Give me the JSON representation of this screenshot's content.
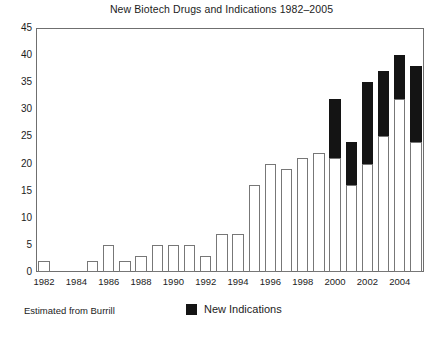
{
  "chart_data": {
    "type": "bar",
    "title": "New Biotech Drugs and Indications 1982–2005",
    "xlabel": "",
    "ylabel": "",
    "stacked": true,
    "grid": false,
    "ylim": [
      0,
      45
    ],
    "ytick_step": 5,
    "yticks": [
      "0",
      "5",
      "10",
      "15",
      "20",
      "25",
      "30",
      "35",
      "40",
      "45"
    ],
    "categories": [
      "1982",
      "1983",
      "1984",
      "1985",
      "1986",
      "1987",
      "1988",
      "1989",
      "1990",
      "1991",
      "1992",
      "1993",
      "1994",
      "1995",
      "1996",
      "1997",
      "1998",
      "1999",
      "2000",
      "2001",
      "2002",
      "2003",
      "2004",
      "2005"
    ],
    "xtick_labels": [
      "1982",
      "1984",
      "1986",
      "1988",
      "1990",
      "1992",
      "1994",
      "1996",
      "1998",
      "2000",
      "2002",
      "2004"
    ],
    "series": [
      {
        "name": "New Drugs",
        "color": "#ffffff",
        "edge_color": "#777777",
        "values": [
          2,
          0,
          0,
          2,
          5,
          2,
          3,
          5,
          5,
          5,
          3,
          7,
          7,
          16,
          20,
          19,
          21,
          22,
          21,
          16,
          20,
          25,
          32,
          24
        ]
      },
      {
        "name": "New Indications",
        "color": "#141414",
        "edge_color": "#141414",
        "values": [
          0,
          0,
          0,
          0,
          0,
          0,
          0,
          0,
          0,
          0,
          0,
          0,
          0,
          0,
          0,
          0,
          0,
          0,
          11,
          8,
          15,
          12,
          8,
          14
        ]
      }
    ],
    "totals": [
      2,
      0,
      0,
      2,
      5,
      2,
      3,
      5,
      5,
      5,
      3,
      7,
      7,
      16,
      20,
      19,
      21,
      22,
      32,
      24,
      35,
      37,
      40,
      38
    ],
    "legend": {
      "position": "below-plot-center",
      "entries": [
        {
          "label": "New Indications",
          "color": "#141414"
        }
      ]
    },
    "annotations": [
      {
        "text": "Estimated from Burrill",
        "position": "below-plot-left"
      }
    ]
  },
  "footer": {
    "source_note": "Estimated from Burrill",
    "legend_label": "New Indications"
  },
  "caption": {
    "partial_text": ""
  }
}
